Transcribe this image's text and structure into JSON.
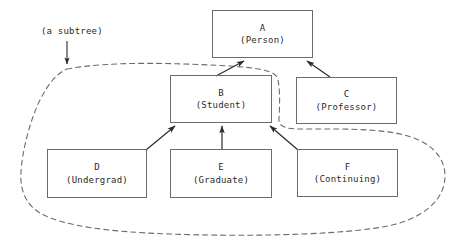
{
  "diagram": {
    "type": "class-inheritance-tree",
    "title_label": "(a subtree)",
    "nodes": [
      {
        "id": "A",
        "name": "A",
        "subtitle": "(Person)",
        "x": 212,
        "y": 10,
        "w": 101,
        "h": 48
      },
      {
        "id": "B",
        "name": "B",
        "subtitle": "(Student)",
        "x": 170,
        "y": 75,
        "w": 102,
        "h": 48
      },
      {
        "id": "C",
        "name": "C",
        "subtitle": "(Professor)",
        "x": 296,
        "y": 77,
        "w": 101,
        "h": 47
      },
      {
        "id": "D",
        "name": "D",
        "subtitle": "(Undergrad)",
        "x": 47,
        "y": 149,
        "w": 100,
        "h": 49
      },
      {
        "id": "E",
        "name": "E",
        "subtitle": "(Graduate)",
        "x": 170,
        "y": 149,
        "w": 102,
        "h": 49
      },
      {
        "id": "F",
        "name": "F",
        "subtitle": "(Continuing)",
        "x": 297,
        "y": 149,
        "w": 101,
        "h": 48
      }
    ],
    "edges": [
      {
        "from": "B",
        "to": "A",
        "arrow": "to"
      },
      {
        "from": "C",
        "to": "A",
        "arrow": "to"
      },
      {
        "from": "D",
        "to": "B",
        "arrow": "to"
      },
      {
        "from": "E",
        "to": "B",
        "arrow": "to"
      },
      {
        "from": "F",
        "to": "B",
        "arrow": "to"
      }
    ],
    "subtree_boundary": {
      "style": "dashed",
      "encloses": [
        "B",
        "D",
        "E",
        "F"
      ]
    },
    "colors": {
      "box_stroke": "#6b6b6b",
      "edge_stroke": "#2a2a2a",
      "dashed_stroke": "#6b6b6b",
      "text": "#2a2a2a",
      "background": "#ffffff"
    }
  }
}
